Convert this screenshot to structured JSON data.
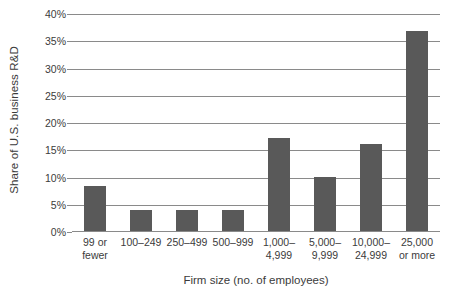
{
  "chart_data": {
    "type": "bar",
    "title": "",
    "subtitle": "",
    "xlabel": "Firm size (no. of employees)",
    "ylabel": "Share of U.S. business R&D",
    "categories": [
      "99 or\nfewer",
      "100–249",
      "250–499",
      "500–999",
      "1,000–\n4,999",
      "5,000–\n9,999",
      "10,000–\n24,999",
      "25,000\nor more"
    ],
    "values": [
      8.5,
      4.0,
      4.0,
      4.0,
      17.2,
      10.1,
      16.2,
      36.8
    ],
    "ylim": [
      0,
      40
    ],
    "ytick_step": 5,
    "ytick_labels": [
      "0%",
      "5%",
      "10%",
      "15%",
      "20%",
      "25%",
      "30%",
      "35%",
      "40%"
    ],
    "grid": true,
    "legend": "none",
    "bar_color": "#595959",
    "grid_color": "#8a8a8a",
    "text_color": "#3b3b3b",
    "background": "#ffffff"
  }
}
